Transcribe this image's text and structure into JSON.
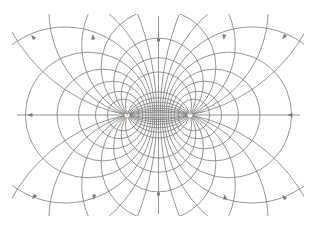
{
  "diagram": {
    "type": "electric-dipole-field",
    "stroke_color": "#7a7a7a",
    "background": "#ffffff",
    "axis": {
      "y": 115,
      "x_start": 17,
      "x_end": 300
    },
    "bisector": {
      "x": 158.5,
      "y_start": 16,
      "y_end": 214
    },
    "charges": [
      {
        "id": "positive",
        "symbol": "+",
        "x": 127,
        "y": 115
      },
      {
        "id": "negative",
        "symbol": "−",
        "x": 190,
        "y": 115
      }
    ],
    "field_line_offsets": [
      10,
      20,
      32,
      48,
      70,
      105,
      165
    ],
    "equipotential_ratios": [
      1.12,
      1.26,
      1.42,
      1.62,
      1.9,
      2.3,
      3.0,
      4.2
    ],
    "bisector_dots": [
      40,
      194
    ]
  }
}
